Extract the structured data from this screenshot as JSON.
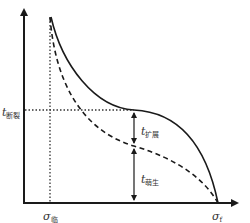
{
  "diagram": {
    "type": "fatigue-life-vs-stress schematic",
    "y_axis_label": "",
    "x_axis_label": "",
    "labels": {
      "t_fracture": {
        "main": "t",
        "sub": "断裂"
      },
      "t_propagation": {
        "main": "t",
        "sub": "扩展"
      },
      "t_initiation": {
        "main": "t",
        "sub": "萌生"
      },
      "sigma_threshold": {
        "main": "σ",
        "sub": "临"
      },
      "sigma_f": {
        "main": "σ",
        "sub": "f"
      }
    },
    "curves": [
      {
        "name": "total-life-curve",
        "style": "solid"
      },
      {
        "name": "initiation-life-curve",
        "style": "dashed"
      }
    ],
    "colors": {
      "line": "#1a1a1a",
      "text": "#333333"
    }
  }
}
